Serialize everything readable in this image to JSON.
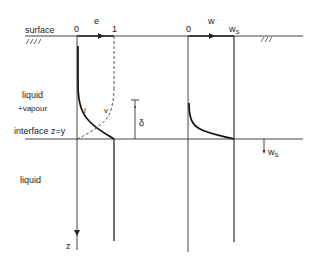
{
  "diagram": {
    "labels": {
      "surface": "surface",
      "liquid_vapour_line1": "liquid",
      "liquid_vapour_line2": "+vapour",
      "interface": "interface  z=y",
      "liquid_bottom": "liquid",
      "z_axis": "z",
      "delta": "δ",
      "e_axis": "e",
      "e_zero": "0",
      "e_one": "1",
      "curve_l": "l",
      "curve_v": "v",
      "w_axis": "w",
      "w_zero": "0",
      "w_s_top": "w",
      "w_s_top_sub": "S",
      "w_s_arrow": "w",
      "w_s_arrow_sub": "S"
    },
    "colors": {
      "line": "#333333",
      "curve": "#111111",
      "background": "#ffffff"
    }
  }
}
